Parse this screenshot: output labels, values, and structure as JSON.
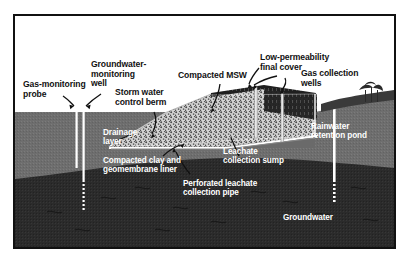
{
  "diagram": {
    "colors": {
      "sky": "#ffffff",
      "frame": "#111111",
      "soil_upper": "#6e6e6e",
      "soil_lower": "#2b2b2b",
      "waste_fill": "#d2d2d2",
      "waste_speckle": "#3a3a3a",
      "liner": "#ffffff",
      "pipe": "#ffffff",
      "cover_veg": "#1f1f1f",
      "leader": "#111111",
      "label_dark": "#111111",
      "label_light": "#ffffff"
    },
    "labels": [
      {
        "id": "gas-monitoring-probe",
        "text": "Gas-monitoring\nprobe",
        "tone": "dark"
      },
      {
        "id": "groundwater-monitoring-well",
        "text": "Groundwater-\nmonitoring\nwell",
        "tone": "dark"
      },
      {
        "id": "storm-water-control-berm",
        "text": "Storm water\ncontrol berm",
        "tone": "dark"
      },
      {
        "id": "compacted-msw",
        "text": "Compacted MSW",
        "tone": "dark"
      },
      {
        "id": "low-permeability-final-cover",
        "text": "Low-permeability\nfinal cover",
        "tone": "dark"
      },
      {
        "id": "gas-collection-wells",
        "text": "Gas collection\nwells",
        "tone": "dark"
      },
      {
        "id": "drainage-layer",
        "text": "Drainage\nlayer",
        "tone": "light"
      },
      {
        "id": "compacted-clay-liner",
        "text": "Compacted clay and\ngeomembrane liner",
        "tone": "light"
      },
      {
        "id": "leachate-collection-sump",
        "text": "Leachate\ncollection sump",
        "tone": "light"
      },
      {
        "id": "perforated-leachate-pipe",
        "text": "Perforated leachate\ncollection pipe",
        "tone": "light"
      },
      {
        "id": "rainwater-retention-pond",
        "text": "Rainwater\nretention pond",
        "tone": "light"
      },
      {
        "id": "groundwater",
        "text": "Groundwater",
        "tone": "light"
      }
    ]
  }
}
